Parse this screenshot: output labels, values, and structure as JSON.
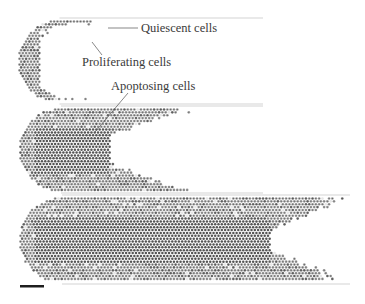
{
  "figure": {
    "labels": {
      "quiescent": "Quiescent cells",
      "proliferating": "Proliferating cells",
      "apoptosing": "Apoptosing cells"
    },
    "panels": [
      {
        "name": "early-stage",
        "relative_length": 1.0,
        "necrotic_core": false
      },
      {
        "name": "middle-stage",
        "relative_length": 2.1,
        "necrotic_core": true
      },
      {
        "name": "late-stage",
        "relative_length": 4.0,
        "necrotic_core": true
      }
    ],
    "colors": {
      "quiescent": "#9a9a9a",
      "proliferating": "#6e6e6e",
      "apoptosing": "#555555",
      "background": "#ffffff",
      "channel_wall": "#c8c8c8",
      "scale_bar": "#1e1e1e"
    }
  }
}
